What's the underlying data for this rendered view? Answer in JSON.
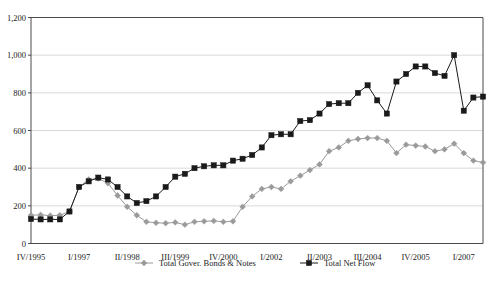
{
  "chart_data": {
    "type": "line",
    "title": "",
    "xlabel": "",
    "ylabel": "",
    "ylim": [
      0,
      1200
    ],
    "grid": true,
    "legend_position": "bottom",
    "yticks": [
      "0",
      "200",
      "400",
      "600",
      "800",
      "1,000",
      "1,200"
    ],
    "ytick_values": [
      0,
      200,
      400,
      600,
      800,
      1000,
      1200
    ],
    "xticks": [
      "IV/1995",
      "I/1997",
      "II/1998",
      "III/1999",
      "IV/2000",
      "I/2002",
      "II/2003",
      "III/2004",
      "IV/2005",
      "I/2007"
    ],
    "xtick_indices": [
      0,
      5,
      10,
      15,
      20,
      25,
      30,
      35,
      40,
      45
    ],
    "x": [
      "IV/1995",
      "I/1996",
      "II/1996",
      "III/1996",
      "IV/1996",
      "I/1997",
      "II/1997",
      "III/1997",
      "IV/1997",
      "I/1998",
      "II/1998",
      "III/1998",
      "IV/1998",
      "I/1999",
      "II/1999",
      "III/1999",
      "IV/1999",
      "I/2000",
      "II/2000",
      "III/2000",
      "IV/2000",
      "I/2001",
      "II/2001",
      "III/2001",
      "IV/2001",
      "I/2002",
      "II/2002",
      "III/2002",
      "IV/2002",
      "I/2003",
      "II/2003",
      "III/2003",
      "IV/2003",
      "I/2004",
      "II/2004",
      "III/2004",
      "IV/2004",
      "I/2005",
      "II/2005",
      "III/2005",
      "IV/2005",
      "I/2006",
      "II/2006",
      "III/2006",
      "IV/2006",
      "I/2007",
      "II/2007",
      "III/2007"
    ],
    "series": [
      {
        "name": "Total Gover. Bonds & Notes",
        "color": "#9a9a9a",
        "marker": "diamond",
        "values": [
          150,
          152,
          148,
          150,
          170,
          300,
          340,
          345,
          320,
          255,
          195,
          150,
          115,
          110,
          108,
          112,
          100,
          115,
          118,
          120,
          115,
          118,
          195,
          250,
          290,
          300,
          290,
          330,
          360,
          390,
          420,
          490,
          510,
          545,
          555,
          560,
          560,
          545,
          480,
          525,
          520,
          515,
          490,
          500,
          530,
          480,
          440,
          430
        ]
      },
      {
        "name": "Total Net Flow",
        "color": "#1a1a1a",
        "marker": "square",
        "values": [
          130,
          128,
          128,
          128,
          170,
          300,
          330,
          350,
          340,
          300,
          250,
          215,
          225,
          250,
          300,
          355,
          370,
          400,
          410,
          415,
          415,
          440,
          450,
          470,
          510,
          575,
          580,
          580,
          650,
          655,
          690,
          740,
          745,
          745,
          800,
          840,
          760,
          690,
          860,
          900,
          940,
          940,
          905,
          890,
          1000,
          705,
          775,
          780
        ]
      }
    ]
  },
  "legend": {
    "items": [
      {
        "label": "Total Gover. Bonds & Notes",
        "marker": "diamond-marker"
      },
      {
        "label": "Total Net Flow",
        "marker": "square-marker"
      }
    ]
  }
}
